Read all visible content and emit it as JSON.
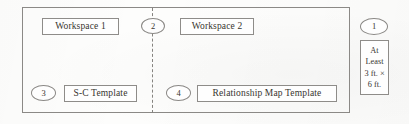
{
  "diagram": {
    "background_color": "#fdfdfc",
    "line_color": "#8b8986",
    "text_color": "#37352f",
    "room": {
      "name": "outer-room-boundary",
      "divider_style": "dashed"
    },
    "labels": [
      {
        "id": "workspace-1",
        "text": "Workspace 1"
      },
      {
        "id": "workspace-2",
        "text": "Workspace 2"
      },
      {
        "id": "sc-template",
        "text": "S-C Template"
      },
      {
        "id": "relationship-map-template",
        "text": "Relationship Map Template"
      }
    ],
    "callouts": [
      {
        "id": "callout-1",
        "number": "1"
      },
      {
        "id": "callout-2",
        "number": "2"
      },
      {
        "id": "callout-3",
        "number": "3"
      },
      {
        "id": "callout-4",
        "number": "4"
      }
    ],
    "dimension_note": {
      "id": "minimum-dimension",
      "lines": [
        "At",
        "Least",
        "3 ft. ×",
        "6 ft."
      ],
      "full_text": "At Least 3 ft. × 6 ft."
    }
  }
}
